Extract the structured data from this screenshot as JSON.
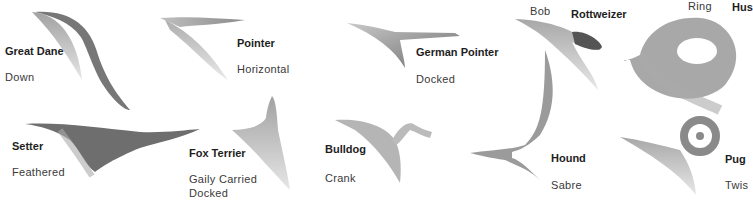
{
  "tails": [
    {
      "breed": "Great Dane",
      "type": "Down"
    },
    {
      "breed": "Pointer",
      "type": "Horizontal"
    },
    {
      "breed": "German Pointer",
      "type": "Docked"
    },
    {
      "breed": "Rottweizer",
      "type": "Bob"
    },
    {
      "breed": "Hus",
      "type": "Ring"
    },
    {
      "breed": "Setter",
      "type": "Feathered"
    },
    {
      "breed": "Fox Terrier",
      "type": "Gaily Carried",
      "type2": "Docked"
    },
    {
      "breed": "Bulldog",
      "type": "Crank"
    },
    {
      "breed": "Hound",
      "type": "Sabre"
    },
    {
      "breed": "Pug",
      "type": "Twis"
    }
  ],
  "colors": {
    "tail_dark": "#6e6e6e",
    "tail_light": "#b8b8b8",
    "background": "#ffffff"
  }
}
